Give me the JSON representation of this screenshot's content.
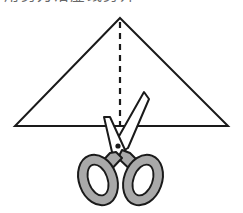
{
  "figure": {
    "name": "triangle-symmetry-cut-figure",
    "kind": "geometry-illustration",
    "background_color": "#ffffff"
  },
  "caption": {
    "text": "用剪刀沿虚线剪开",
    "clipped": "true"
  },
  "triangle": {
    "label": "triangle",
    "stroke_color": "#1a1a1a",
    "fill_color": "#ffffff",
    "stroke_width": "2",
    "apex": {
      "x": 120,
      "y": 18
    },
    "left_vertex": {
      "x": 15,
      "y": 126
    },
    "right_vertex": {
      "x": 228,
      "y": 126
    }
  },
  "fold_line": {
    "label": "dashed line of symmetry",
    "stroke_color": "#1a1a1a",
    "stroke_width": "2.2",
    "dash_pattern": "6 5",
    "x": 120,
    "y_top": 22,
    "y_bottom": 126
  },
  "scissors": {
    "label": "scissors",
    "outline_color": "#1a1a1a",
    "blade_fill": "#ffffff",
    "handle_fill": "#a9a9a9",
    "handle_hole_fill": "#ffffff",
    "pivot_color": "#1a1a1a",
    "pivot": {
      "x": 118,
      "y": 146
    },
    "right_blade_tip": {
      "x": 144,
      "y": 93
    },
    "left_blade_tip": {
      "x": 104,
      "y": 118
    },
    "handles_bottom_y": 206
  }
}
